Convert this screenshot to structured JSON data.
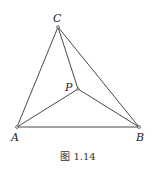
{
  "figure": {
    "caption": "图 1.14",
    "points": {
      "A": {
        "label": "A",
        "x": 17,
        "y": 127
      },
      "B": {
        "label": "B",
        "x": 139,
        "y": 127
      },
      "C": {
        "label": "C",
        "x": 58,
        "y": 27
      },
      "P": {
        "label": "P",
        "x": 78,
        "y": 89
      }
    },
    "segments": [
      [
        "A",
        "B"
      ],
      [
        "B",
        "C"
      ],
      [
        "C",
        "A"
      ],
      [
        "P",
        "A"
      ],
      [
        "P",
        "B"
      ],
      [
        "P",
        "C"
      ]
    ]
  }
}
